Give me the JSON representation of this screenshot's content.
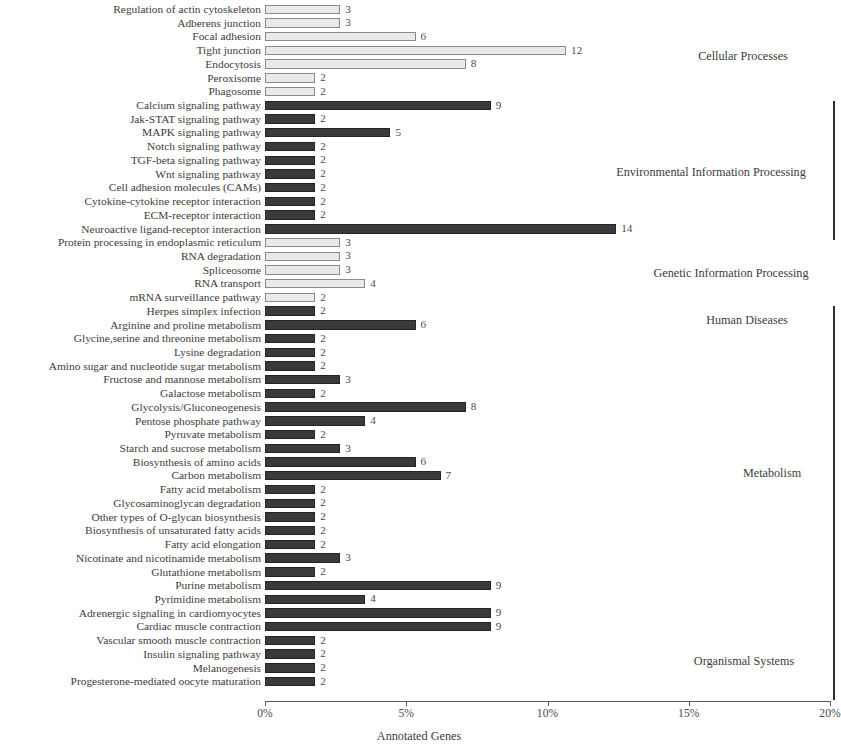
{
  "chart_data": {
    "type": "bar",
    "orientation": "horizontal",
    "title": "",
    "xlabel": "Annotated Genes",
    "ylabel": "",
    "xlim": [
      0,
      20
    ],
    "x_unit": "%",
    "xticks": [
      "0%",
      "5%",
      "10%",
      "15%",
      "20%"
    ],
    "xtick_values": [
      0,
      5,
      10,
      15,
      20
    ],
    "grid": false,
    "legend": "none",
    "value_label_note": "Bar end labels are absolute annotated gene counts; x axis is percent of annotated genes.",
    "percent_per_gene": 0.888,
    "categories": [
      "Regulation of actin cytoskeleton",
      "Adberens junction",
      "Focal adhesion",
      "Tight junction",
      "Endocytosis",
      "Peroxisome",
      "Phagosome",
      "Calcium signaling pathway",
      "Jak-STAT signaling pathway",
      "MAPK signaling pathway",
      "Notch signaling pathway",
      "TGF-beta signaling pathway",
      "Wnt signaling pathway",
      "Cell adhesion molecules (CAMs)",
      "Cytokine-cytokine receptor interaction",
      "ECM-receptor interaction",
      "Neuroactive ligand-receptor interaction",
      "Protein processing in endoplasmic reticulum",
      "RNA degradation",
      "Spliceosome",
      "RNA transport",
      "mRNA surveillance pathway",
      "Herpes simplex infection",
      "Arginine and proline metabolism",
      "Glycine,serine and threonine metabolism",
      "Lysine degradation",
      "Amino sugar and nucleotide sugar metabolism",
      "Fructose and mannose metabolism",
      "Galactose metabolism",
      "Glycolysis/Gluconeogenesis",
      "Pentose phosphate pathway",
      "Pyruvate metabolism",
      "Starch and sucrose metabolism",
      "Biosynthesis of amino acids",
      "Carbon metabolism",
      "Fatty acid metabolism",
      "Glycosaminoglycan degradation",
      "Other types of O-glycan biosynthesis",
      "Biosynthesis of unsaturated fatty acids",
      "Fatty acid elongation",
      "Nicotinate and nicotinamide metabolism",
      "Glutathione metabolism",
      "Purine metabolism",
      "Pyrimidine metabolism",
      "Adrenergic signaling in cardiomyocytes",
      "Cardiac muscle contraction",
      "Vascular smooth muscle contraction",
      "Insulin signaling pathway",
      "Melanogenesis",
      "Progesterone-mediated oocyte maturation"
    ],
    "values": [
      3,
      3,
      6,
      12,
      8,
      2,
      2,
      9,
      2,
      5,
      2,
      2,
      2,
      2,
      2,
      2,
      14,
      3,
      3,
      3,
      4,
      2,
      2,
      6,
      2,
      2,
      2,
      3,
      2,
      8,
      4,
      2,
      3,
      6,
      7,
      2,
      2,
      2,
      2,
      2,
      3,
      2,
      9,
      4,
      9,
      9,
      2,
      2,
      2,
      2
    ],
    "bar_styles": [
      "light",
      "light",
      "light",
      "light",
      "light",
      "light",
      "light",
      "dark",
      "dark",
      "dark",
      "dark",
      "dark",
      "dark",
      "dark",
      "dark",
      "dark",
      "dark",
      "light",
      "light",
      "light",
      "light",
      "light",
      "dark",
      "dark",
      "dark",
      "dark",
      "dark",
      "dark",
      "dark",
      "dark",
      "dark",
      "dark",
      "dark",
      "dark",
      "dark",
      "dark",
      "dark",
      "dark",
      "dark",
      "dark",
      "dark",
      "dark",
      "dark",
      "dark",
      "dark",
      "dark",
      "dark",
      "dark",
      "dark",
      "dark"
    ],
    "groups": [
      {
        "name": "Cellular Processes",
        "start_index": 0,
        "end_index": 6,
        "bracket": false
      },
      {
        "name": "Environmental Information Processing",
        "start_index": 7,
        "end_index": 16,
        "bracket": true
      },
      {
        "name": "Genetic Information Processing",
        "start_index": 17,
        "end_index": 21,
        "bracket": false
      },
      {
        "name": "Human Diseases",
        "start_index": 22,
        "end_index": 22,
        "bracket": false
      },
      {
        "name": "Metabolism",
        "start_index": 23,
        "end_index": 41,
        "bracket": true
      },
      {
        "name": "Organismal Systems",
        "start_index": 42,
        "end_index": 49,
        "bracket": true
      }
    ]
  },
  "colors": {
    "light_bar_fill": "#e9e9e9",
    "light_bar_stroke": "#8a8a8a",
    "dark_bar_fill": "#3a3a3a",
    "dark_bar_stroke": "#242424",
    "text": "#3c3c3c",
    "axis": "#5a5a5a",
    "background": "#ffffff"
  },
  "axis": {
    "x_title": "Annotated Genes",
    "ticks": [
      "0%",
      "5%",
      "10%",
      "15%",
      "20%"
    ]
  },
  "category_labels": [
    {
      "text": "Cellular Processes",
      "x": 743,
      "y": 56
    },
    {
      "text": "Environmental Information Processing",
      "x": 711,
      "y": 172
    },
    {
      "text": "Genetic Information Processing",
      "x": 731,
      "y": 273
    },
    {
      "text": "Human Diseases",
      "x": 747,
      "y": 320
    },
    {
      "text": "Metabolism",
      "x": 772,
      "y": 473
    },
    {
      "text": "Organismal Systems",
      "x": 744,
      "y": 661
    }
  ],
  "brackets": [
    {
      "top": 101,
      "height": 139
    },
    {
      "top": 306,
      "height": 394
    }
  ]
}
